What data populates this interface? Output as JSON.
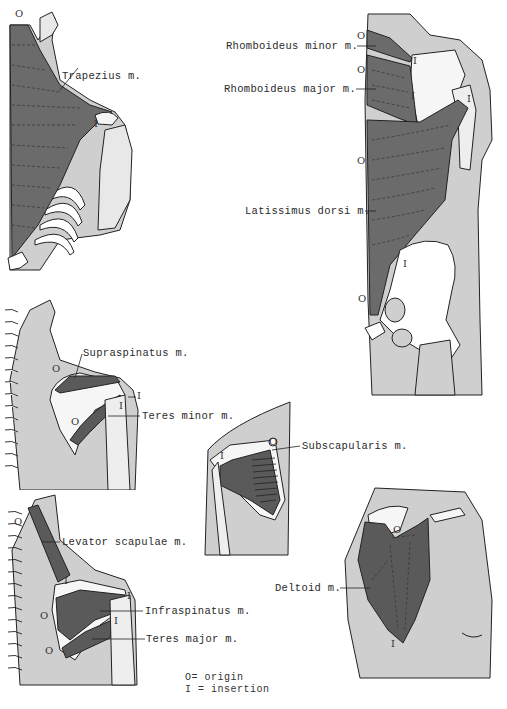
{
  "figure": {
    "panels": [
      {
        "id": "trapezius",
        "muscle_label": "Trapezius m.",
        "origin_mark": "O",
        "insertion_mark": "I"
      },
      {
        "id": "rhomboideus-latissimus",
        "labels": [
          "Rhomboideus minor m.",
          "Rhomboideus major m.",
          "Latissimus dorsi m."
        ],
        "origin_marks": [
          "O",
          "O",
          "O",
          "O"
        ],
        "insertion_marks": [
          "I",
          "I",
          "I",
          "I"
        ]
      },
      {
        "id": "supraspinatus-teres-minor",
        "labels": [
          "Supraspinatus m.",
          "Teres minor m."
        ],
        "origin_marks": [
          "O",
          "O"
        ],
        "insertion_marks": [
          "I",
          "I"
        ]
      },
      {
        "id": "subscapularis",
        "labels": [
          "Subscapularis m."
        ],
        "origin_mark": "O",
        "insertion_mark": "I"
      },
      {
        "id": "levator-infraspinatus-teres-major",
        "labels": [
          "Levator scapulae m.",
          "Infraspinatus m.",
          "Teres major m."
        ],
        "origin_marks": [
          "O",
          "O",
          "O"
        ],
        "insertion_marks": [
          "I",
          "I",
          "I"
        ]
      },
      {
        "id": "deltoid",
        "labels": [
          "Deltoid m."
        ],
        "origin_mark": "O",
        "insertion_mark": "I"
      }
    ],
    "legend": {
      "origin": "O= origin",
      "insertion": "I = insertion"
    },
    "colors": {
      "muscle": "#6b6b6b",
      "skin": "#c8c8c8",
      "bone": "#f4f4f4",
      "outline": "#222222"
    }
  }
}
